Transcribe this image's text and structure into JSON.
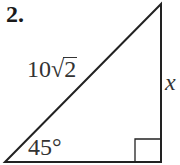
{
  "problem": {
    "number": "2."
  },
  "triangle": {
    "type": "right-triangle",
    "hypotenuse_label_coef": "10",
    "hypotenuse_label_radical": "√",
    "hypotenuse_label_radicand": "2",
    "vertical_leg_label": "x",
    "angle_label": "45°",
    "stroke_color": "#222222"
  }
}
